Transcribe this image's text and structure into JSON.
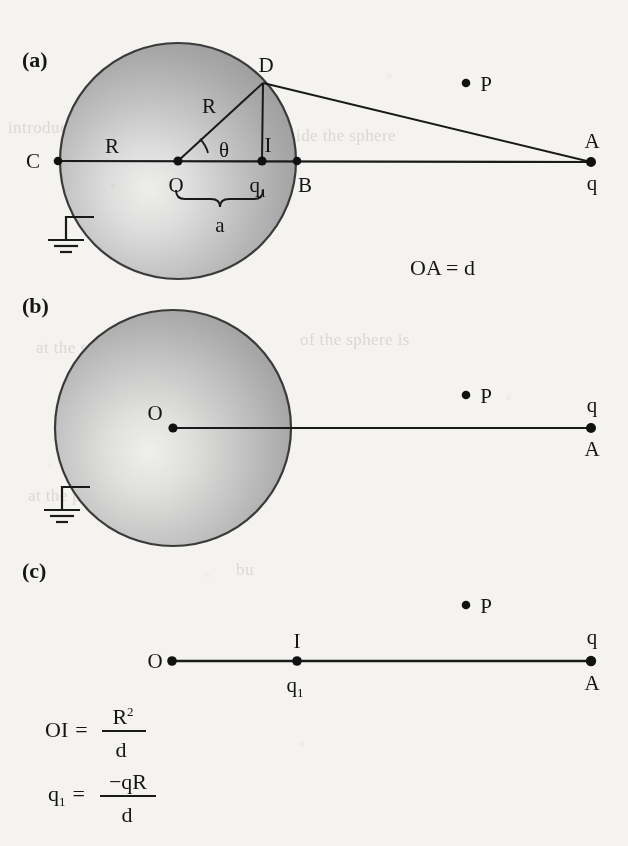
{
  "figure": {
    "background_color": "#f4f3f0",
    "ink_color": "#1a1a1a",
    "sphere_fill_dark": "#9a9a9a",
    "sphere_fill_light": "#e4e4e0"
  },
  "panels": [
    {
      "id": "a",
      "label": "(a)",
      "sphere": {
        "center": [
          178,
          161
        ],
        "radius": 118,
        "grounded": true
      },
      "points": [
        {
          "name": "C",
          "label": "C",
          "x": 58,
          "y": 161
        },
        {
          "name": "O",
          "label": "O",
          "x": 178,
          "y": 161
        },
        {
          "name": "I",
          "label": "I",
          "x": 262,
          "y": 161,
          "sublabel": "q",
          "subscript": "1"
        },
        {
          "name": "B",
          "label": "B",
          "x": 297,
          "y": 161
        },
        {
          "name": "D",
          "label": "D",
          "x": 263,
          "y": 83
        },
        {
          "name": "A",
          "label": "A",
          "x": 591,
          "y": 162,
          "charge_label": "q"
        },
        {
          "name": "P",
          "label": "P",
          "x": 466,
          "y": 83
        }
      ],
      "segment_labels": [
        {
          "name": "radius-left",
          "text": "R"
        },
        {
          "name": "radius-to-D",
          "text": "R"
        },
        {
          "name": "angle-theta",
          "text": "θ"
        },
        {
          "name": "brace-a",
          "text": "a"
        }
      ]
    },
    {
      "id": "b",
      "label": "(b)",
      "sphere": {
        "center": [
          173,
          428
        ],
        "radius": 118,
        "grounded": true
      },
      "points": [
        {
          "name": "O",
          "label": "O",
          "x": 173,
          "y": 428
        },
        {
          "name": "A",
          "label": "A",
          "x": 591,
          "y": 428,
          "charge_label": "q"
        },
        {
          "name": "P",
          "label": "P",
          "x": 466,
          "y": 395
        }
      ]
    },
    {
      "id": "c",
      "label": "(c)",
      "sphere": null,
      "points": [
        {
          "name": "O",
          "label": "O",
          "x": 172,
          "y": 661
        },
        {
          "name": "I",
          "label": "I",
          "x": 297,
          "y": 661,
          "sublabel": "q",
          "subscript": "1"
        },
        {
          "name": "A",
          "label": "A",
          "x": 591,
          "y": 661,
          "charge_label": "q"
        },
        {
          "name": "P",
          "label": "P",
          "x": 466,
          "y": 605
        }
      ]
    }
  ],
  "annotations": {
    "distance_note": "OA = d"
  },
  "equations": [
    {
      "name": "image-distance",
      "lhs": "OI",
      "relation": "=",
      "numerator": "R",
      "numerator_exponent": "2",
      "denominator": "d"
    },
    {
      "name": "image-charge",
      "lhs": "q",
      "lhs_subscript": "1",
      "relation": "=",
      "numerator": "−qR",
      "numerator_exponent": "",
      "denominator": "d"
    }
  ],
  "background_text": [
    {
      "text": "introduced",
      "x": 8,
      "y": 118
    },
    {
      "text": "The field outside the sphere",
      "x": 196,
      "y": 126
    },
    {
      "text": "at the surface",
      "x": 36,
      "y": 338
    },
    {
      "text": "of the sphere is",
      "x": 300,
      "y": 330
    },
    {
      "text": "at the point of the image",
      "x": 28,
      "y": 486
    },
    {
      "text": "bu",
      "x": 236,
      "y": 560
    }
  ]
}
